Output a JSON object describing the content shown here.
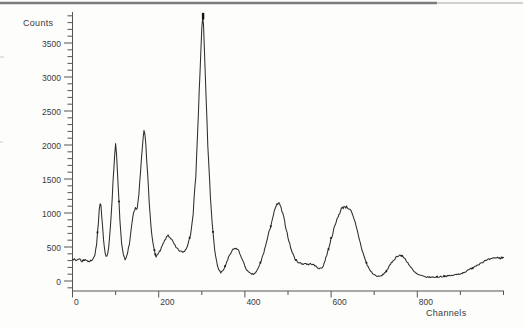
{
  "figure": {
    "ylabel": "Counts",
    "xlabel": "Channels",
    "colors": {
      "background": "#fdfdfc",
      "curve": "#2e2e2e",
      "axis": "#555555",
      "text": "#3b3b3b",
      "top_border": "#7d7d7d",
      "top_border_faint": "#c2c2c2",
      "dot": "#1c1c1c"
    }
  },
  "chart_data": {
    "type": "line",
    "title": "",
    "xlabel": "Channels",
    "ylabel": "Counts",
    "xlim": [
      0,
      1000
    ],
    "ylim": [
      0,
      3950
    ],
    "grid": false,
    "legend": null,
    "x_major_ticks": [
      0,
      200,
      400,
      600,
      800
    ],
    "x_minor_tick_step": 100,
    "y_major_ticks": [
      0,
      500,
      1000,
      1500,
      2000,
      2500,
      3000,
      3500
    ],
    "y_minor_tick_step": 100,
    "series": [
      {
        "name": "spectrum",
        "points": [
          [
            0,
            330
          ],
          [
            8,
            300
          ],
          [
            15,
            330
          ],
          [
            22,
            290
          ],
          [
            30,
            320
          ],
          [
            38,
            280
          ],
          [
            45,
            310
          ],
          [
            52,
            380
          ],
          [
            56,
            550
          ],
          [
            60,
            850
          ],
          [
            63,
            1140
          ],
          [
            66,
            1100
          ],
          [
            69,
            850
          ],
          [
            72,
            600
          ],
          [
            76,
            410
          ],
          [
            79,
            345
          ],
          [
            83,
            450
          ],
          [
            87,
            700
          ],
          [
            91,
            1100
          ],
          [
            95,
            1550
          ],
          [
            98,
            1850
          ],
          [
            100,
            2030
          ],
          [
            103,
            1800
          ],
          [
            106,
            1400
          ],
          [
            110,
            900
          ],
          [
            114,
            550
          ],
          [
            118,
            400
          ],
          [
            122,
            300
          ],
          [
            127,
            380
          ],
          [
            132,
            550
          ],
          [
            137,
            800
          ],
          [
            142,
            1000
          ],
          [
            146,
            1060
          ],
          [
            149,
            1020
          ],
          [
            152,
            1150
          ],
          [
            156,
            1450
          ],
          [
            160,
            1800
          ],
          [
            164,
            2100
          ],
          [
            167,
            2230
          ],
          [
            170,
            2000
          ],
          [
            174,
            1600
          ],
          [
            178,
            1150
          ],
          [
            183,
            750
          ],
          [
            188,
            500
          ],
          [
            193,
            360
          ],
          [
            198,
            390
          ],
          [
            204,
            450
          ],
          [
            210,
            540
          ],
          [
            216,
            620
          ],
          [
            222,
            675
          ],
          [
            228,
            630
          ],
          [
            234,
            560
          ],
          [
            240,
            490
          ],
          [
            247,
            450
          ],
          [
            254,
            425
          ],
          [
            260,
            435
          ],
          [
            267,
            520
          ],
          [
            274,
            700
          ],
          [
            280,
            1000
          ],
          [
            286,
            1550
          ],
          [
            291,
            2300
          ],
          [
            296,
            3100
          ],
          [
            300,
            3700
          ],
          [
            303,
            3930
          ],
          [
            306,
            3400
          ],
          [
            310,
            2700
          ],
          [
            314,
            2000
          ],
          [
            319,
            1350
          ],
          [
            324,
            850
          ],
          [
            329,
            500
          ],
          [
            334,
            290
          ],
          [
            339,
            170
          ],
          [
            344,
            120
          ],
          [
            350,
            160
          ],
          [
            357,
            260
          ],
          [
            364,
            370
          ],
          [
            371,
            450
          ],
          [
            378,
            485
          ],
          [
            384,
            460
          ],
          [
            390,
            380
          ],
          [
            396,
            280
          ],
          [
            402,
            190
          ],
          [
            408,
            130
          ],
          [
            414,
            105
          ],
          [
            420,
            100
          ],
          [
            426,
            130
          ],
          [
            432,
            200
          ],
          [
            439,
            320
          ],
          [
            446,
            470
          ],
          [
            453,
            640
          ],
          [
            460,
            820
          ],
          [
            467,
            990
          ],
          [
            473,
            1110
          ],
          [
            478,
            1150
          ],
          [
            483,
            1090
          ],
          [
            489,
            960
          ],
          [
            495,
            790
          ],
          [
            501,
            620
          ],
          [
            507,
            470
          ],
          [
            513,
            370
          ],
          [
            519,
            300
          ],
          [
            526,
            270
          ],
          [
            533,
            250
          ],
          [
            540,
            260
          ],
          [
            547,
            240
          ],
          [
            554,
            255
          ],
          [
            561,
            230
          ],
          [
            568,
            200
          ],
          [
            574,
            180
          ],
          [
            580,
            200
          ],
          [
            586,
            300
          ],
          [
            592,
            430
          ],
          [
            600,
            620
          ],
          [
            608,
            790
          ],
          [
            616,
            950
          ],
          [
            624,
            1060
          ],
          [
            631,
            1100
          ],
          [
            638,
            1080
          ],
          [
            644,
            1060
          ],
          [
            650,
            960
          ],
          [
            656,
            850
          ],
          [
            663,
            680
          ],
          [
            670,
            500
          ],
          [
            677,
            350
          ],
          [
            684,
            230
          ],
          [
            691,
            150
          ],
          [
            698,
            100
          ],
          [
            705,
            75
          ],
          [
            711,
            65
          ],
          [
            718,
            80
          ],
          [
            726,
            130
          ],
          [
            734,
            205
          ],
          [
            742,
            285
          ],
          [
            750,
            345
          ],
          [
            757,
            380
          ],
          [
            764,
            370
          ],
          [
            771,
            330
          ],
          [
            778,
            270
          ],
          [
            785,
            200
          ],
          [
            792,
            140
          ],
          [
            800,
            100
          ],
          [
            810,
            75
          ],
          [
            820,
            60
          ],
          [
            832,
            55
          ],
          [
            844,
            60
          ],
          [
            856,
            65
          ],
          [
            868,
            72
          ],
          [
            880,
            82
          ],
          [
            892,
            95
          ],
          [
            904,
            115
          ],
          [
            916,
            150
          ],
          [
            928,
            195
          ],
          [
            940,
            240
          ],
          [
            950,
            275
          ],
          [
            960,
            300
          ],
          [
            968,
            318
          ],
          [
            976,
            330
          ],
          [
            984,
            345
          ],
          [
            992,
            335
          ],
          [
            1000,
            350
          ]
        ]
      }
    ]
  }
}
